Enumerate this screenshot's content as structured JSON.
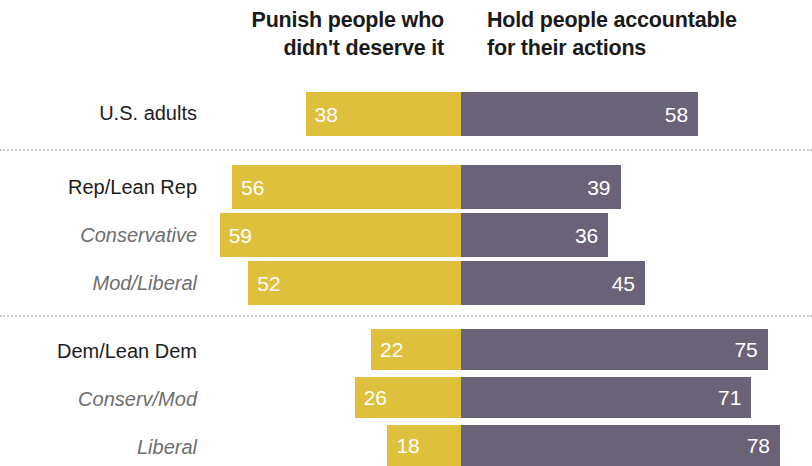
{
  "chart_data": {
    "type": "bar",
    "subtype": "diverging-stacked-bar",
    "title": "",
    "xlabel": "",
    "ylabel": "",
    "grid": false,
    "legend_position": "top",
    "axis_center_value": 0,
    "value_unit": "percent",
    "categories": [
      "U.S. adults",
      "Rep/Lean Rep",
      "Conservative",
      "Mod/Liberal",
      "Dem/Lean Dem",
      "Conserv/Mod",
      "Liberal"
    ],
    "series": [
      {
        "name": "Punish people who didn't deserve it",
        "color": "#dfc03c",
        "values": [
          38,
          56,
          59,
          52,
          22,
          26,
          18
        ]
      },
      {
        "name": "Hold people accountable for their actions",
        "color": "#6a6377",
        "values": [
          58,
          39,
          36,
          45,
          75,
          71,
          78
        ]
      }
    ]
  },
  "headers": {
    "left": {
      "line1": "Punish people who",
      "line2": "didn't deserve it"
    },
    "right": {
      "line1": "Hold people accountable",
      "line2": "for their actions"
    }
  },
  "rows": [
    {
      "label": "U.S. adults",
      "style": "main",
      "left": 38,
      "right": 58
    },
    {
      "label": "Rep/Lean Rep",
      "style": "main",
      "left": 56,
      "right": 39
    },
    {
      "label": "Conservative",
      "style": "sub",
      "left": 59,
      "right": 36
    },
    {
      "label": "Mod/Liberal",
      "style": "sub",
      "left": 52,
      "right": 45
    },
    {
      "label": "Dem/Lean Dem",
      "style": "main",
      "left": 22,
      "right": 75
    },
    {
      "label": "Conserv/Mod",
      "style": "sub",
      "left": 26,
      "right": 71
    },
    {
      "label": "Liberal",
      "style": "sub",
      "left": 18,
      "right": 78
    }
  ],
  "colors": {
    "left_segment": "#dfc03c",
    "right_segment": "#6a6377",
    "value_text": "#ffffff",
    "label_main": "#1c1c1c",
    "label_sub": "#6e6e6e",
    "separator": "#c9c7c9"
  }
}
